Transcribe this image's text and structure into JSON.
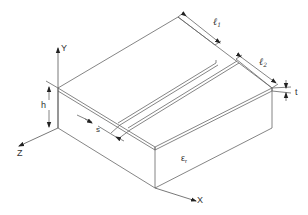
{
  "diagram": {
    "axes": {
      "x_label": "X",
      "y_label": "Y",
      "z_label": "Z"
    },
    "dimensions": {
      "l1": {
        "symbol": "ℓ",
        "subscript": "1"
      },
      "l2": {
        "symbol": "ℓ",
        "subscript": "2"
      },
      "h": "h",
      "s": "s",
      "t": "t"
    },
    "substrate": {
      "symbol": "ε",
      "subscript": "r"
    },
    "colors": {
      "line": "#555555",
      "background": "#ffffff"
    }
  }
}
